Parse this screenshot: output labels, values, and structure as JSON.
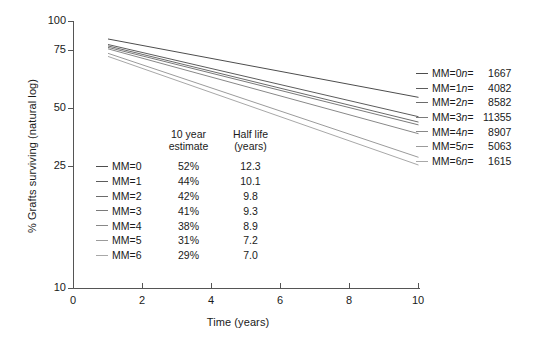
{
  "chart_data": {
    "type": "line",
    "title": "",
    "xlabel": "Time (years)",
    "ylabel": "% Grafts surviving (natural log)",
    "xlim": [
      0,
      10.6
    ],
    "ylim": [
      10,
      100
    ],
    "yscale": "log",
    "xticks": [
      0,
      2,
      4,
      6,
      8,
      10
    ],
    "xtick_labels": [
      "0",
      "2",
      "4",
      "6",
      "8",
      "10"
    ],
    "yticks": [
      10,
      25,
      50,
      75,
      100
    ],
    "ytick_labels": [
      "10",
      "25",
      "50",
      "75",
      "100"
    ],
    "grid": false,
    "legend_position": "right",
    "x": [
      1,
      10
    ],
    "series": [
      {
        "name": "MM=0",
        "label": "MM=0",
        "n": "1667",
        "ten_year_estimate": "52%",
        "half_life": "12.3",
        "values": [
          86,
          52
        ],
        "color": "#4d4d4d"
      },
      {
        "name": "MM=1",
        "label": "MM=1",
        "n": "4082",
        "ten_year_estimate": "44%",
        "half_life": "10.1",
        "values": [
          82,
          44
        ],
        "color": "#5c5c5c"
      },
      {
        "name": "MM=2",
        "label": "MM=2",
        "n": "8582",
        "ten_year_estimate": "42%",
        "half_life": "9.8",
        "values": [
          81,
          42
        ],
        "color": "#6b6b6b"
      },
      {
        "name": "MM=3",
        "label": "MM=3",
        "n": "11355",
        "ten_year_estimate": "41%",
        "half_life": "9.3",
        "values": [
          80,
          41
        ],
        "color": "#7a7a7a"
      },
      {
        "name": "MM=4",
        "label": "MM=4",
        "n": "8907",
        "ten_year_estimate": "38%",
        "half_life": "8.9",
        "values": [
          79,
          38
        ],
        "color": "#888888"
      },
      {
        "name": "MM=5",
        "label": "MM=5",
        "n": "5063",
        "ten_year_estimate": "31%",
        "half_life": "7.2",
        "values": [
          76,
          31
        ],
        "color": "#9b9b9b"
      },
      {
        "name": "MM=6",
        "label": "MM=6",
        "n": "1615",
        "ten_year_estimate": "29%",
        "half_life": "7.0",
        "values": [
          74,
          29
        ],
        "color": "#a8a8a8"
      }
    ]
  },
  "inner_table": {
    "headers": {
      "swatch": "",
      "series": "",
      "estimate_line1": "10 year",
      "estimate_line2": "estimate",
      "halflife_line1": "Half life",
      "halflife_line2": "(years)"
    }
  },
  "right_legend": {
    "n_prefix": "n="
  },
  "axes": {
    "x_title": "Time (years)",
    "y_title": "% Grafts surviving (natural log)"
  }
}
